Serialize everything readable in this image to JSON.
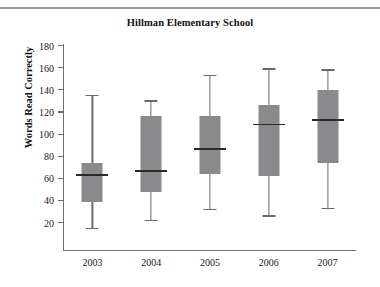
{
  "page": {
    "background": "#ffffff",
    "top_rule_color": "#9a9aa0"
  },
  "chart_data": {
    "type": "box",
    "title": "Hillman Elementary School",
    "xlabel": "",
    "ylabel": "Words Read Correctly",
    "categories": [
      "2003",
      "2004",
      "2005",
      "2006",
      "2007"
    ],
    "ylim": [
      0,
      180
    ],
    "yticks": [
      20,
      40,
      60,
      80,
      100,
      120,
      140,
      160,
      180
    ],
    "ytick_labels": [
      "20",
      "40",
      "60",
      "80",
      "100",
      "120",
      "140",
      "160",
      "180"
    ],
    "grid": false,
    "legend": null,
    "box_fill": "#8a8a8c",
    "box_line": "#6a6a6e",
    "median_color": "#2a2a2a",
    "boxes": [
      {
        "category": "2003",
        "min": 15,
        "q1": 38,
        "median": 63,
        "q3": 73,
        "max": 135
      },
      {
        "category": "2004",
        "min": 22,
        "q1": 47,
        "median": 67,
        "q3": 116,
        "max": 130
      },
      {
        "category": "2005",
        "min": 32,
        "q1": 63,
        "median": 87,
        "q3": 116,
        "max": 153
      },
      {
        "category": "2006",
        "min": 26,
        "q1": 62,
        "median": 109,
        "q3": 126,
        "max": 159
      },
      {
        "category": "2007",
        "min": 33,
        "q1": 73,
        "median": 113,
        "q3": 139,
        "max": 158
      }
    ]
  }
}
